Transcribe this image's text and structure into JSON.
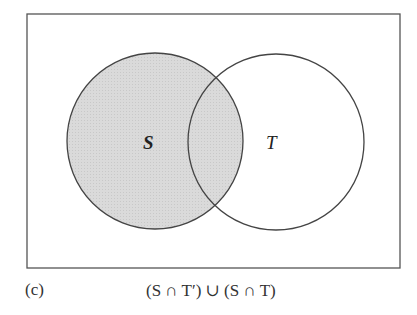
{
  "diagram": {
    "type": "venn",
    "universe": {
      "x": 27,
      "y": 14,
      "width": 373,
      "height": 254
    },
    "sets": [
      {
        "name": "S",
        "label": "S",
        "cx": 155,
        "cy": 141,
        "r": 88,
        "shaded": true
      },
      {
        "name": "T",
        "label": "T",
        "cx": 276,
        "cy": 142,
        "r": 88,
        "shaded": false
      }
    ],
    "shaded_region": "S",
    "colors": {
      "shade": "#d9d9d9",
      "stroke": "#444444",
      "background": "#ffffff"
    }
  },
  "caption": {
    "part_label": "(c)",
    "expression": "(S ∩ T′) ∪ (S ∩ T)"
  }
}
